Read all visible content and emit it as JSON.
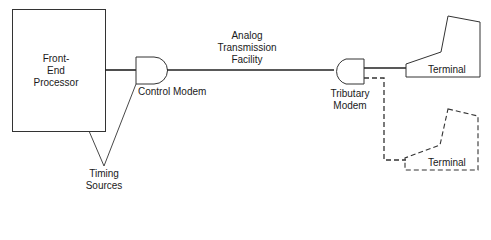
{
  "diagram": {
    "front_end_processor": {
      "line1": "Front-",
      "line2": "End",
      "line3": "Processor"
    },
    "control_modem": "Control Modem",
    "analog_facility": {
      "line1": "Analog",
      "line2": "Transmission",
      "line3": "Facility"
    },
    "tributary_modem": {
      "line1": "Tributary",
      "line2": "Modem"
    },
    "terminal_1": "Terminal",
    "terminal_2": "Terminal",
    "timing_sources": {
      "line1": "Timing",
      "line2": "Sources"
    }
  }
}
